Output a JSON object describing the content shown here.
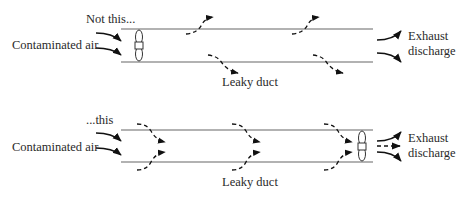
{
  "top_panel": {
    "caption": "Not this...",
    "inlet_label": "Contaminated air",
    "outlet_label_line1": "Exhaust",
    "outlet_label_line2": "discharge",
    "duct_label": "Leaky duct",
    "fan_position": "inlet"
  },
  "bottom_panel": {
    "caption": "...this",
    "inlet_label": "Contaminated air",
    "outlet_label_line1": "Exhaust",
    "outlet_label_line2": "discharge",
    "duct_label": "Leaky duct",
    "fan_position": "outlet"
  },
  "colors": {
    "line": "#555555",
    "arrow": "#111111",
    "text": "#2a2a2a"
  }
}
